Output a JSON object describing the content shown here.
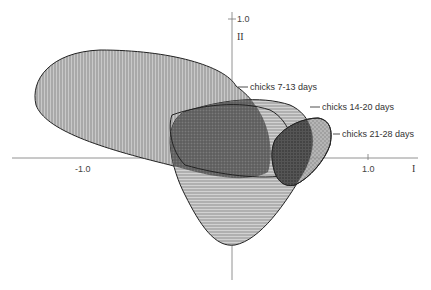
{
  "figure": {
    "axes": {
      "x_axis_label": "I",
      "y_axis_label": "II",
      "x_ticks": [
        "-1.0",
        "1.0"
      ],
      "y_ticks": [
        "1.0"
      ]
    },
    "groups": [
      {
        "label": "chicks  7-13 days",
        "pattern": "vertical-hatch",
        "fill": "#b8b8b8"
      },
      {
        "label": "chicks 14-20 days",
        "pattern": "horizontal-hatch",
        "fill": "#c4c4c4"
      },
      {
        "label": "chicks 21-28 days",
        "pattern": "stipple",
        "fill": "#eaeaea"
      }
    ],
    "overlap_regions": [
      {
        "name": "overlap-7-13-and-14-20",
        "pattern": "crosshatch",
        "fill": "#6e6e6e"
      },
      {
        "name": "overlap-all",
        "pattern": "dense-stipple",
        "fill": "#4a4a4a"
      }
    ],
    "colors": {
      "axis": "#777777",
      "outline": "#222222"
    }
  }
}
